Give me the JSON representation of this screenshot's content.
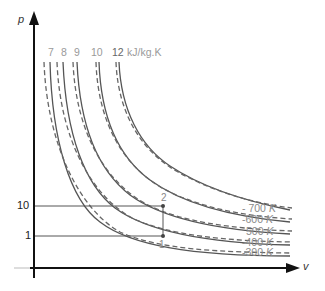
{
  "diagram": {
    "type": "p-v diagram with isentropes and isotherms",
    "axes": {
      "y_label": "p",
      "x_label": "v"
    },
    "pressure_ticks": [
      {
        "label": "10",
        "y": 206
      },
      {
        "label": "1",
        "y": 236
      }
    ],
    "entropy_labels": {
      "values": [
        "7",
        "8",
        "9",
        "10",
        "12"
      ],
      "unit": "kJ/kg.K"
    },
    "temperature_labels": [
      {
        "value": "700",
        "unit": "K"
      },
      {
        "value": "600",
        "unit": "K"
      },
      {
        "value": "500",
        "unit": "K"
      },
      {
        "value": "400",
        "unit": "K"
      },
      {
        "value": "300",
        "unit": "K"
      }
    ],
    "points": [
      {
        "label": "1",
        "x": 163,
        "y": 236
      },
      {
        "label": "2",
        "x": 163,
        "y": 206
      }
    ],
    "colors": {
      "axis": "#111111",
      "solid_curve": "#555555",
      "dashed_curve": "#666666",
      "guide_line": "#555555",
      "label_grey": "#9a9a9a"
    }
  }
}
